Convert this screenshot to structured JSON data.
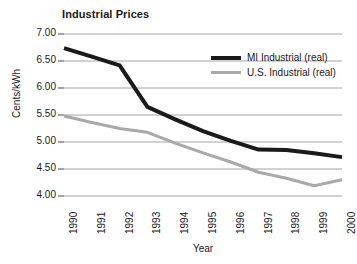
{
  "chart_data": {
    "type": "line",
    "title": "Industrial Prices",
    "xlabel": "Year",
    "ylabel": "Cents/kWh",
    "categories": [
      "1990",
      "1991",
      "1992",
      "1993",
      "1994",
      "1995",
      "1996",
      "1997",
      "1998",
      "1999",
      "2000"
    ],
    "ylim": [
      4.0,
      7.0
    ],
    "yticks": [
      "4.00",
      "4.50",
      "5.00",
      "5.50",
      "6.00",
      "6.50",
      "7.00"
    ],
    "ytick_values": [
      4.0,
      4.5,
      5.0,
      5.5,
      6.0,
      6.5,
      7.0
    ],
    "grid": true,
    "legend_position": "upper right",
    "series": [
      {
        "name": "MI Industrial (real)",
        "color": "#1a1a1a",
        "width": 4,
        "values": [
          6.74,
          6.58,
          6.42,
          5.65,
          5.42,
          5.2,
          5.02,
          4.86,
          4.85,
          4.79,
          4.72
        ]
      },
      {
        "name": "U.S. Industrial (real)",
        "color": "#a9a9a9",
        "width": 3,
        "values": [
          5.48,
          5.36,
          5.25,
          5.18,
          4.98,
          4.8,
          4.63,
          4.44,
          4.33,
          4.19,
          4.3
        ]
      }
    ]
  }
}
